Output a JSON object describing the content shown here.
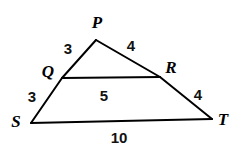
{
  "figure": {
    "kind": "geometry-diagram",
    "background_color": "#ffffff",
    "stroke_color": "#000000",
    "stroke_width": 2,
    "vertices": [
      {
        "id": "P",
        "label": "P",
        "x": 96,
        "y": 40,
        "label_x": 97,
        "label_y": 22
      },
      {
        "id": "Q",
        "label": "Q",
        "x": 62,
        "y": 78,
        "label_x": 48,
        "label_y": 71
      },
      {
        "id": "R",
        "label": "R",
        "x": 160,
        "y": 77,
        "label_x": 171,
        "label_y": 67
      },
      {
        "id": "S",
        "label": "S",
        "x": 31,
        "y": 123,
        "label_x": 16,
        "label_y": 121
      },
      {
        "id": "T",
        "label": "T",
        "x": 212,
        "y": 119,
        "label_x": 223,
        "label_y": 119
      }
    ],
    "segments": [
      {
        "id": "PQ",
        "from": "P",
        "to": "Q"
      },
      {
        "id": "QS",
        "from": "Q",
        "to": "S"
      },
      {
        "id": "PR",
        "from": "P",
        "to": "R"
      },
      {
        "id": "RT",
        "from": "R",
        "to": "T"
      },
      {
        "id": "QR",
        "from": "Q",
        "to": "R"
      },
      {
        "id": "ST",
        "from": "S",
        "to": "T"
      }
    ],
    "measures": [
      {
        "id": "PQ",
        "value": "3",
        "x": 68,
        "y": 48
      },
      {
        "id": "PR",
        "value": "4",
        "x": 131,
        "y": 45
      },
      {
        "id": "QS",
        "value": "3",
        "x": 32,
        "y": 96
      },
      {
        "id": "RT",
        "value": "4",
        "x": 198,
        "y": 94
      },
      {
        "id": "QR",
        "value": "5",
        "x": 104,
        "y": 95
      },
      {
        "id": "ST",
        "value": "10",
        "x": 119,
        "y": 137
      }
    ]
  }
}
